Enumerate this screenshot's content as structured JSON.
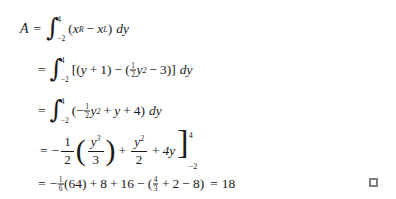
{
  "document": {
    "kind": "math-derivation",
    "background_color": "#ffffff",
    "text_color": "#1a1a1a",
    "marker_color": "#7d7d7d"
  },
  "derivation": {
    "line1": {
      "lhs": "A",
      "equals": "=",
      "integral_symbol": "∫",
      "lower_limit": "−2",
      "upper_limit": "4",
      "open_paren": "(",
      "x_r_base": "x",
      "x_r_sub": "R",
      "minus": "−",
      "x_l_base": "x",
      "x_l_sub": "L",
      "close_paren": ")",
      "differential": "dy"
    },
    "line2": {
      "equals": "=",
      "integral_symbol": "∫",
      "lower_limit": "−2",
      "upper_limit": "4",
      "open_bracket": "[",
      "inner_open_paren": "(",
      "y": "y",
      "plus": "+",
      "one": "1",
      "inner_close_paren": ")",
      "minus": "−",
      "group_open_paren": "(",
      "half_num": "1",
      "half_den": "2",
      "y2_base": "y",
      "y2_exp": "2",
      "minus2": "−",
      "three": "3",
      "group_close_paren": ")",
      "close_bracket": "]",
      "differential": "dy"
    },
    "line3": {
      "equals": "=",
      "integral_symbol": "∫",
      "lower_limit": "−2",
      "upper_limit": "4",
      "open_paren": "(",
      "leading_minus": "−",
      "half_num": "1",
      "half_den": "2",
      "y2_base": "y",
      "y2_exp": "2",
      "plus1": "+",
      "y": "y",
      "plus2": "+",
      "four": "4",
      "close_paren": ")",
      "differential": "dy"
    },
    "line4": {
      "equals": "=",
      "leading_minus": "−",
      "half_num": "1",
      "half_den": "2",
      "open_paren": "(",
      "inner_num_base": "y",
      "inner_num_exp": "3",
      "inner_den": "3",
      "close_paren": ")",
      "plus1": "+",
      "frac2_num_base": "y",
      "frac2_num_exp": "2",
      "frac2_den": "2",
      "plus2": "+",
      "four_y": "4y",
      "bracket": "]",
      "upper_limit": "4",
      "lower_limit": "−2"
    },
    "line5": {
      "equals": "=",
      "leading_minus": "−",
      "sixth_num": "1",
      "sixth_den": "6",
      "value_64": "(64)",
      "plus1": "+",
      "eight": "8",
      "plus2": "+",
      "sixteen": "16",
      "minus": "−",
      "open_paren": "(",
      "frac_num": "4",
      "frac_den": "3",
      "plus3": "+",
      "two": "2",
      "minus2": "−",
      "eight2": "8",
      "close_paren": ")",
      "final_equals": "=",
      "result": "18"
    }
  },
  "end_marker": {
    "name": "end-of-proof-square",
    "glyph": "□"
  }
}
